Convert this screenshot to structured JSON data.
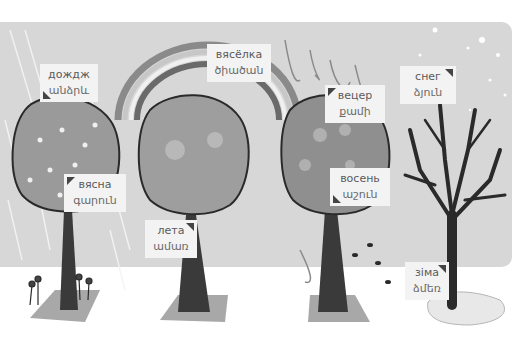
{
  "scene": {
    "title": "Seasons and weather vocabulary",
    "colors": {
      "sky": "#d7d7d7",
      "ground": "#ffffff",
      "label_bg": "#f3f3f3",
      "patch": "#a8a8a8"
    }
  },
  "labels": [
    {
      "id": "rain",
      "ru": "дождж",
      "hy": "անձրև",
      "x": 40,
      "y": 64
    },
    {
      "id": "rainbow",
      "ru": "вясёлка",
      "hy": "ծիածան",
      "x": 207,
      "y": 44
    },
    {
      "id": "wind",
      "ru": "вецер",
      "hy": "քամի",
      "x": 325,
      "y": 85
    },
    {
      "id": "snow",
      "ru": "снег",
      "hy": "ձյուն",
      "x": 400,
      "y": 66
    },
    {
      "id": "spring",
      "ru": "вясна",
      "hy": "գարուն",
      "x": 64,
      "y": 174
    },
    {
      "id": "autumn",
      "ru": "восень",
      "hy": "աշուն",
      "x": 330,
      "y": 168
    },
    {
      "id": "summer",
      "ru": "лета",
      "hy": "ամառ",
      "x": 145,
      "y": 220
    },
    {
      "id": "winter",
      "ru": "зіма",
      "hy": "ձմեռ",
      "x": 405,
      "y": 262
    }
  ],
  "trees": [
    {
      "season": "spring",
      "x": 65
    },
    {
      "season": "summer",
      "x": 190
    },
    {
      "season": "autumn",
      "x": 330
    },
    {
      "season": "winter",
      "x": 455
    }
  ]
}
